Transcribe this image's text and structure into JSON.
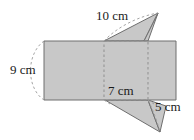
{
  "figure": {
    "kind": "geometry-net-diagram",
    "background_color": "#ffffff",
    "shape_fill_color": "#c8c8c8",
    "shape_stroke_color": "#6e6e6e",
    "dashed_stroke_color": "#9a9a9a",
    "label_color": "#1a1a1a",
    "canvas": {
      "width": 194,
      "height": 140
    },
    "body_rectangle": {
      "name": "main-rectangle",
      "points": "44,41 176,41 176,100 44,100"
    },
    "dashed_face": {
      "name": "dashed-square-face",
      "points": "104,41 148,41 148,100 104,100"
    },
    "top_triangle": {
      "name": "upper-triangle",
      "points": "104,41 158,13 144,41"
    },
    "top_triangle_notch": {
      "name": "upper-triangle-notch",
      "points": "158,13 148,41 144,41"
    },
    "bottom_triangle": {
      "name": "lower-triangle",
      "points": "105,100 160,132 148,100"
    },
    "bottom_triangle_notch": {
      "name": "lower-triangle-notch",
      "points": "148,100 160,132 166,106"
    },
    "leaders": {
      "nine_cm_arc": "M 44,41 C 26,54 26,88 44,100",
      "ten_cm_arc": "M 104,41 C 118,26 140,16 158,13",
      "five_cm_arc": "M 148,100 C 154,112 158,124 160,132",
      "seven_cm_left_tick": "M 104,100 L 110,104",
      "seven_cm_right_tick": "M 148,100 L 154,104"
    },
    "labels": [
      {
        "id": "label-9cm",
        "text": "9 cm",
        "x": 10,
        "y": 71,
        "anchor": "start"
      },
      {
        "id": "label-10cm",
        "text": "10 cm",
        "x": 96,
        "y": 17,
        "anchor": "start"
      },
      {
        "id": "label-7cm",
        "text": "7 cm",
        "x": 108,
        "y": 92,
        "anchor": "start"
      },
      {
        "id": "label-5cm",
        "text": "5 cm",
        "x": 155,
        "y": 108,
        "anchor": "start"
      }
    ]
  }
}
